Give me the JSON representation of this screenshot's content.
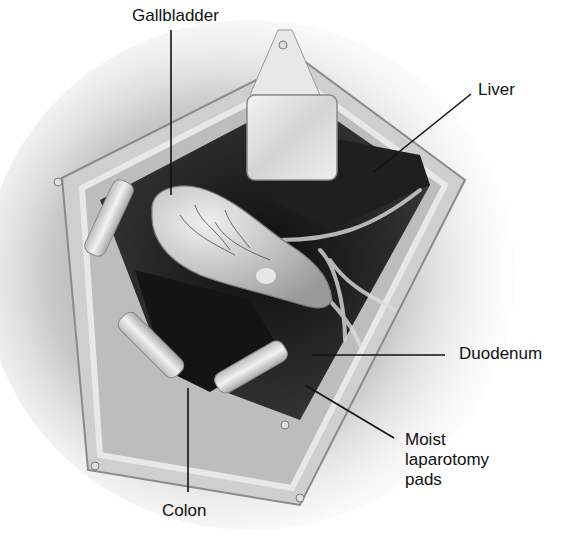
{
  "figure": {
    "type": "surgical-anatomy-illustration",
    "colors": {
      "background": "#ffffff",
      "line": "#111111",
      "cavity": "#1a1a1a",
      "tissue": "#d8d8d8",
      "retractor": "#e6e6e6"
    }
  },
  "labels": [
    {
      "id": "gallbladder",
      "text": "Gallbladder",
      "x": 132,
      "y": 6,
      "line": [
        171,
        30,
        171,
        195
      ]
    },
    {
      "id": "liver",
      "text": "Liver",
      "x": 478,
      "y": 80,
      "line": [
        471,
        94,
        374,
        172
      ]
    },
    {
      "id": "duodenum",
      "text": "Duodenum",
      "x": 459,
      "y": 344,
      "line": [
        445,
        355,
        312,
        355
      ]
    },
    {
      "id": "moist-laparotomy-pads",
      "lines": [
        "Moist",
        "laparotomy",
        "pads"
      ],
      "x": 405,
      "y": 430,
      "line": [
        394,
        438,
        305,
        385
      ]
    },
    {
      "id": "colon",
      "text": "Colon",
      "x": 162,
      "y": 501,
      "line": [
        188,
        492,
        188,
        388
      ]
    }
  ]
}
